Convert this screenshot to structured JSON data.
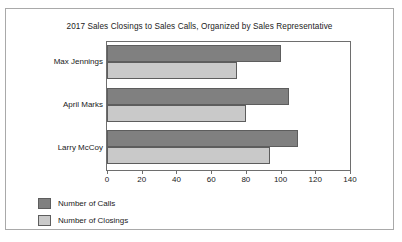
{
  "chart_data": {
    "type": "bar",
    "orientation": "horizontal",
    "title": "2017 Sales Closings to Sales Calls, Organized by Sales Representative",
    "xlabel": "",
    "ylabel": "",
    "categories": [
      "Max Jennings",
      "April Marks",
      "Larry McCoy"
    ],
    "series": [
      {
        "name": "Number of Calls",
        "color": "#808080",
        "values": [
          100,
          105,
          110
        ]
      },
      {
        "name": "Number of Closings",
        "color": "#c9c9c9",
        "values": [
          75,
          80,
          94
        ]
      }
    ],
    "xlim": [
      0,
      140
    ],
    "xticks": [
      0,
      20,
      40,
      60,
      80,
      100,
      120,
      140
    ],
    "xtick_labels": [
      "0",
      "20",
      "40",
      "60",
      "80",
      "100",
      "120",
      "140"
    ],
    "grid": false,
    "legend_position": "below-left"
  }
}
